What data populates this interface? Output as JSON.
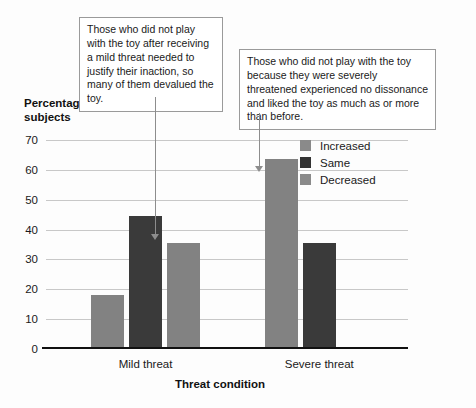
{
  "chart_data": {
    "type": "bar",
    "title": "",
    "xlabel": "Threat condition",
    "ylabel": "Percentage of subjects",
    "ylim": [
      0,
      70
    ],
    "yticks": [
      0,
      10,
      20,
      30,
      40,
      50,
      60,
      70
    ],
    "grid": true,
    "legend_position": "upper-right-inside",
    "categories": [
      "Mild threat",
      "Severe threat"
    ],
    "series": [
      {
        "name": "Increased",
        "color": "#828282",
        "values": [
          18,
          63.5
        ]
      },
      {
        "name": "Same",
        "color": "#3a3a3a",
        "values": [
          44.5,
          35.5
        ]
      },
      {
        "name": "Decreased",
        "color": "#828282",
        "values": [
          35.5,
          0
        ]
      }
    ],
    "annotations": [
      {
        "id": "callout-mild",
        "text": "Those who did not play with the toy after receiving a mild threat needed to justify their inaction, so many of them devalued the toy.",
        "points_to": "Mild threat / Decreased bar"
      },
      {
        "id": "callout-severe",
        "text": "Those who did not play with the toy because they were severely threatened experienced no dissonance and liked the toy as much as or more than before.",
        "points_to": "Severe threat / Increased bar"
      }
    ]
  },
  "axis": {
    "y_title_line1": "Percentage of",
    "y_title_line2": "subjects",
    "x_title": "Threat condition",
    "ytick_labels": [
      "70",
      "60",
      "50",
      "40",
      "30",
      "20",
      "10",
      "0"
    ],
    "category_labels": [
      "Mild threat",
      "Severe threat"
    ]
  },
  "legend": {
    "items": [
      {
        "label": "Increased"
      },
      {
        "label": "Same"
      },
      {
        "label": "Decreased"
      }
    ]
  },
  "callouts": {
    "mild": "Those who did not play with the toy after receiving a mild threat needed to justify their inaction, so many of them devalued the toy.",
    "severe": "Those who did not play with the toy because they were severely threatened experienced no dissonance and liked the toy as much as or more than before."
  },
  "colors": {
    "increased": "#828282",
    "same": "#3a3a3a",
    "decreased": "#828282",
    "axis": "#111111",
    "grid": "#c8c8c8",
    "callout_border": "#9a9a9a",
    "leader": "#8d8d8d"
  }
}
